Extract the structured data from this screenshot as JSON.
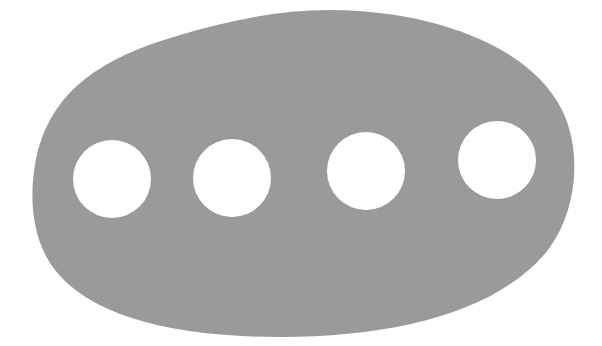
{
  "figure": {
    "colors": {
      "background": "#ffffff",
      "plate": "#9a9a9a",
      "hole": "#ffffff"
    },
    "holes": [
      {
        "cx": 112,
        "cy": 179,
        "r": 39
      },
      {
        "cx": 232,
        "cy": 178,
        "r": 39
      },
      {
        "cx": 366,
        "cy": 171,
        "r": 39
      },
      {
        "cx": 497,
        "cy": 160,
        "r": 39
      }
    ],
    "hole_count": 4
  }
}
